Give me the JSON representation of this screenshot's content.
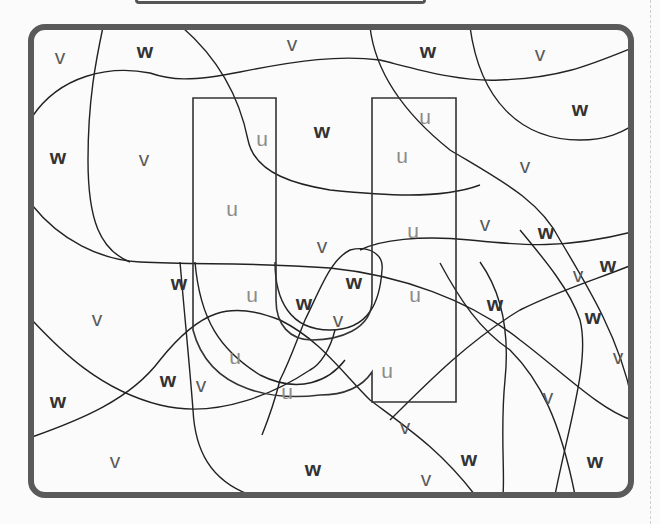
{
  "worksheet": {
    "type": "color-by-letter puzzle",
    "hidden_letter": "u",
    "frame_color": "#5a5a5a",
    "letter_colors": {
      "u": "#8c8c8c",
      "v": "#5a5a5a",
      "w": "#333333"
    },
    "labels": [
      {
        "t": "v",
        "x": 60,
        "y": 58
      },
      {
        "t": "w",
        "x": 145,
        "y": 52
      },
      {
        "t": "v",
        "x": 292,
        "y": 45
      },
      {
        "t": "w",
        "x": 428,
        "y": 52
      },
      {
        "t": "v",
        "x": 540,
        "y": 55
      },
      {
        "t": "w",
        "x": 580,
        "y": 110
      },
      {
        "t": "u",
        "x": 425,
        "y": 118
      },
      {
        "t": "w",
        "x": 322,
        "y": 132
      },
      {
        "t": "u",
        "x": 262,
        "y": 140
      },
      {
        "t": "w",
        "x": 58,
        "y": 158
      },
      {
        "t": "v",
        "x": 144,
        "y": 160
      },
      {
        "t": "u",
        "x": 402,
        "y": 157
      },
      {
        "t": "v",
        "x": 525,
        "y": 167
      },
      {
        "t": "u",
        "x": 232,
        "y": 210
      },
      {
        "t": "v",
        "x": 485,
        "y": 225
      },
      {
        "t": "w",
        "x": 546,
        "y": 233
      },
      {
        "t": "u",
        "x": 413,
        "y": 232
      },
      {
        "t": "v",
        "x": 322,
        "y": 247
      },
      {
        "t": "w",
        "x": 179,
        "y": 284
      },
      {
        "t": "w",
        "x": 354,
        "y": 283
      },
      {
        "t": "v",
        "x": 578,
        "y": 276
      },
      {
        "t": "w",
        "x": 608,
        "y": 266
      },
      {
        "t": "u",
        "x": 252,
        "y": 296
      },
      {
        "t": "w",
        "x": 304,
        "y": 304
      },
      {
        "t": "v",
        "x": 338,
        "y": 321
      },
      {
        "t": "u",
        "x": 415,
        "y": 296
      },
      {
        "t": "w",
        "x": 495,
        "y": 305
      },
      {
        "t": "v",
        "x": 97,
        "y": 320
      },
      {
        "t": "w",
        "x": 593,
        "y": 318
      },
      {
        "t": "u",
        "x": 235,
        "y": 358
      },
      {
        "t": "u",
        "x": 387,
        "y": 372
      },
      {
        "t": "v",
        "x": 618,
        "y": 358
      },
      {
        "t": "w",
        "x": 168,
        "y": 381
      },
      {
        "t": "v",
        "x": 201,
        "y": 386
      },
      {
        "t": "u",
        "x": 287,
        "y": 393
      },
      {
        "t": "w",
        "x": 58,
        "y": 402
      },
      {
        "t": "v",
        "x": 548,
        "y": 398
      },
      {
        "t": "v",
        "x": 405,
        "y": 428
      },
      {
        "t": "w",
        "x": 469,
        "y": 460
      },
      {
        "t": "w",
        "x": 595,
        "y": 462
      },
      {
        "t": "v",
        "x": 115,
        "y": 462
      },
      {
        "t": "w",
        "x": 313,
        "y": 470
      },
      {
        "t": "v",
        "x": 426,
        "y": 480
      }
    ]
  }
}
